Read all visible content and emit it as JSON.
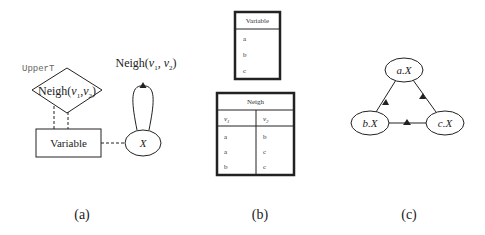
{
  "panel_a": {
    "upper_label": "UpperT",
    "diamond_label_prefix": "Neigh(",
    "diamond_v1": "v",
    "diamond_v1_sub": "1",
    "diamond_sep": ",",
    "diamond_v2": "v",
    "diamond_v2_sub": "2",
    "diamond_suffix": ")",
    "entity_label": "Variable",
    "node_label": "X",
    "loop_label_prefix": "Neigh(",
    "loop_v1": "v",
    "loop_v1_sub": "1",
    "loop_sep": ", ",
    "loop_v2": "v",
    "loop_v2_sub": "2",
    "loop_suffix": ")",
    "caption": "(a)"
  },
  "panel_b": {
    "variable_table": {
      "header": "Variable",
      "rows": [
        "a",
        "b",
        "c"
      ]
    },
    "neigh_table": {
      "header": "Neigh",
      "columns": [
        {
          "name": "v",
          "sub": "1"
        },
        {
          "name": "v",
          "sub": "2"
        }
      ],
      "rows": [
        [
          "a",
          "b"
        ],
        [
          "a",
          "c"
        ],
        [
          "b",
          "c"
        ]
      ]
    },
    "caption": "(b)"
  },
  "panel_c": {
    "nodes": [
      {
        "id": "a",
        "label": "a.X"
      },
      {
        "id": "b",
        "label": "b.X"
      },
      {
        "id": "c",
        "label": "c.X"
      }
    ],
    "edges": [
      {
        "from": "b",
        "to": "a"
      },
      {
        "from": "c",
        "to": "a"
      },
      {
        "from": "b",
        "to": "c"
      }
    ],
    "caption": "(c)"
  },
  "colors": {
    "stroke": "#222222",
    "text": "#222222",
    "background": "#ffffff"
  }
}
